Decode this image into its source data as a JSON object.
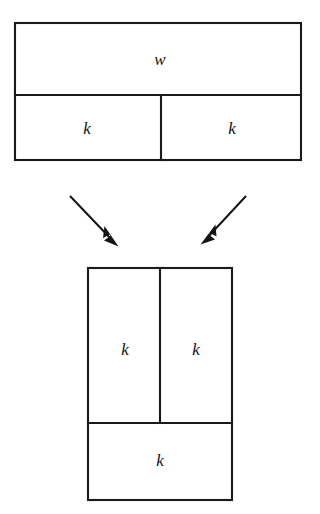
{
  "diagram": {
    "background_color": "#ffffff",
    "line_color": "#1a1a1a",
    "text_color": "#111111"
  },
  "top_figure": {
    "name": "wide-rectangle",
    "bounds": {
      "x": 15,
      "y": 23,
      "width": 286,
      "height": 137
    },
    "horizontal_divider_y": 95,
    "vertical_divider_x": 161,
    "cells": [
      {
        "id": "top-band",
        "label": "w",
        "cx": 160,
        "cy": 60
      },
      {
        "id": "bottom-left-cell",
        "label": "k",
        "cx": 87,
        "cy": 129
      },
      {
        "id": "bottom-right-cell",
        "label": "k",
        "cx": 232,
        "cy": 129
      }
    ]
  },
  "arrows": [
    {
      "id": "left-arrow",
      "from": {
        "x": 70,
        "y": 196
      },
      "to": {
        "x": 118,
        "y": 246
      }
    },
    {
      "id": "right-arrow",
      "from": {
        "x": 246,
        "y": 196
      },
      "to": {
        "x": 201,
        "y": 244
      }
    }
  ],
  "bottom_figure": {
    "name": "tall-rectangle",
    "bounds": {
      "x": 88,
      "y": 268,
      "width": 144,
      "height": 232
    },
    "horizontal_divider_y": 423,
    "vertical_divider_x": 160,
    "cells": [
      {
        "id": "upper-left-cell",
        "label": "k",
        "cx": 125,
        "cy": 350
      },
      {
        "id": "upper-right-cell",
        "label": "k",
        "cx": 196,
        "cy": 350
      },
      {
        "id": "lower-band",
        "label": "k",
        "cx": 160,
        "cy": 461
      }
    ]
  }
}
